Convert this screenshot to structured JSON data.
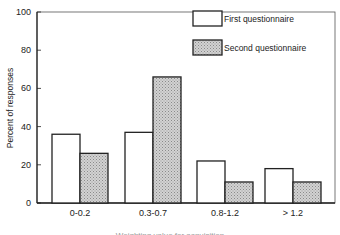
{
  "chart_data": {
    "type": "bar",
    "title": "",
    "xlabel": "Weighting value for acquisition",
    "ylabel": "Percent of responses",
    "ylim": [
      0,
      100
    ],
    "yticks": [
      0,
      20,
      40,
      60,
      80,
      100
    ],
    "grid": false,
    "legend_position": "upper right",
    "categories": [
      "0-0.2",
      "0.3-0.7",
      "0.8-1.2",
      "> 1.2"
    ],
    "series": [
      {
        "name": "First questionnaire",
        "fill": "#ffffff",
        "pattern": "none",
        "values": [
          36,
          37,
          22,
          18
        ]
      },
      {
        "name": "Second questionnaire",
        "fill": "#c8c8c8",
        "pattern": "stipple",
        "values": [
          26,
          66,
          11,
          11
        ]
      }
    ]
  },
  "colors": {
    "axis": "#222222",
    "first_fill": "#ffffff",
    "second_fill": "#c8c8c8"
  }
}
